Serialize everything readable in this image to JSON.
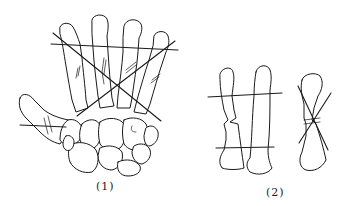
{
  "figure": {
    "panels": [
      {
        "id": "panel-1",
        "label": "(1)",
        "content": "dorsal view of hand skeleton (metacarpals and carpals) with crossing reference lines over metacarpal fractures"
      },
      {
        "id": "panel-2",
        "label": "(2)",
        "content": "two metacarpal bones with parallel transverse lines and a single bone with crossed diagonal lines at a fracture"
      }
    ],
    "colors": {
      "ink": "#1a1a1a",
      "background": "#ffffff"
    }
  }
}
